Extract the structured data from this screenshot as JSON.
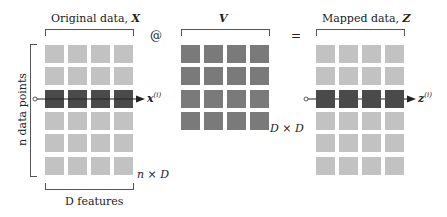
{
  "matrix_x": {
    "title_prefix": "Original data, ",
    "title_symbol": "X",
    "row_axis_label": "n data points",
    "col_axis_label": "D features",
    "shape_label": "n × D",
    "rows": 6,
    "cols": 4,
    "highlight_row": 2,
    "row_vector_label": "x",
    "row_vector_superscript": "(i)"
  },
  "operator_matmul": "@",
  "matrix_v": {
    "title_symbol": "V",
    "shape_label": "D × D",
    "rows": 4,
    "cols": 4
  },
  "operator_equals": "=",
  "matrix_z": {
    "title_prefix": "Mapped data, ",
    "title_symbol": "Z",
    "rows": 6,
    "cols": 4,
    "highlight_row": 2,
    "row_vector_label": "z",
    "row_vector_superscript": "(i)"
  },
  "colors": {
    "cell_light": "#c2c2c2",
    "cell_v": "#7a7a7a",
    "cell_highlight": "#4a4a4a",
    "line": "#222222"
  }
}
